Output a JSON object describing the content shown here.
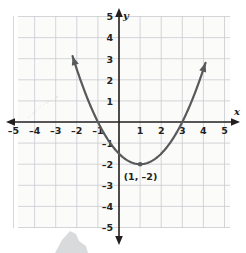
{
  "chart_data": {
    "type": "line",
    "title": "",
    "xlabel": "x",
    "ylabel": "y",
    "xlim": [
      -5.5,
      5.5
    ],
    "ylim": [
      -5.5,
      5.5
    ],
    "grid": true,
    "legend": "none",
    "function": "y = 0.5(x - 1)^2 - 2",
    "x_ticks": [
      "-5",
      "-4",
      "-3",
      "-2",
      "-1",
      "1",
      "2",
      "3",
      "4",
      "5"
    ],
    "x_tick_values": [
      -5,
      -4,
      -3,
      -2,
      -1,
      1,
      2,
      3,
      4,
      5
    ],
    "y_ticks": [
      "5",
      "4",
      "3",
      "2",
      "1",
      "-1",
      "-2",
      "-3",
      "-4",
      "-5"
    ],
    "y_tick_values": [
      5,
      4,
      3,
      2,
      1,
      -1,
      -2,
      -3,
      -4,
      -5
    ],
    "series": [
      {
        "name": "parabola",
        "color": "#58595b",
        "x": [
          -2.2,
          -2.0,
          -1.5,
          -1.0,
          -0.5,
          0.0,
          0.5,
          1.0,
          1.5,
          2.0,
          2.5,
          3.0,
          3.5,
          4.0,
          4.1
        ],
        "y": [
          3.12,
          2.5,
          1.125,
          0.0,
          -0.875,
          -1.5,
          -1.875,
          -2.0,
          -1.875,
          -1.5,
          -0.875,
          0.0,
          1.125,
          2.5,
          2.81
        ]
      }
    ],
    "annotations": [
      {
        "name": "vertex",
        "label": "(1, -2)",
        "x": 1,
        "y": -2,
        "marker": "dot"
      }
    ],
    "x_intercepts": [
      -1,
      3
    ],
    "y_intercept": -1.5,
    "colors": {
      "curve": "#58595b",
      "axis": "#231f20",
      "grid": "#c9ccd1",
      "background": "#fbfbfa",
      "text": "#231f20",
      "smudge": "#d2d3d5"
    }
  },
  "labels": {
    "x_axis_name": "x",
    "y_axis_name": "y",
    "vertex_label": "(1, –2)",
    "x_ticks": [
      "–5",
      "–4",
      "–3",
      "–2",
      "–1",
      "1",
      "2",
      "3",
      "4",
      "5"
    ],
    "y_ticks": [
      "5",
      "4",
      "3",
      "2",
      "1",
      "–1",
      "–2",
      "–3",
      "–4",
      "–5"
    ]
  }
}
